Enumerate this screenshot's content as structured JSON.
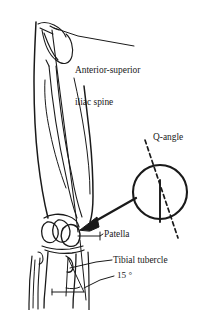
{
  "figure": {
    "background_color": "#ffffff",
    "ink_color": "#1a1a1a"
  },
  "labels": {
    "asis_line1": "Anterior-superior",
    "asis_line2": "iliac spine",
    "q_angle": "Q-angle",
    "patella": "Patella",
    "tibial_tubercle": "Tibial tubercle",
    "angle_value": "15 °"
  },
  "annotations": {
    "measured_angle_degrees": 15,
    "inset_shape": "circle-magnifier",
    "inset_contents": "vertical solid tibial axis line crossed by dashed quadriceps line",
    "arrow_from": "inset-circle",
    "arrow_to": "patella"
  }
}
